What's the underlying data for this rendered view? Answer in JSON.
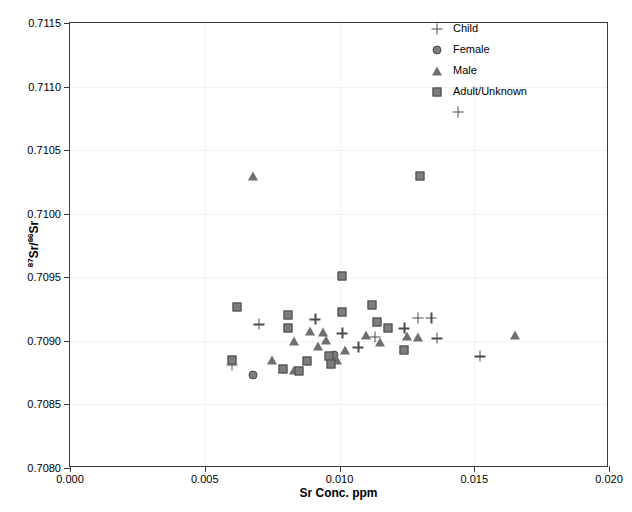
{
  "chart_data": {
    "type": "scatter",
    "title": "",
    "xlabel": "Sr Conc. ppm",
    "ylabel": "87Sr/86Sr",
    "ylabel_parts": {
      "sup1": "87",
      "mid": "Sr/",
      "sup2": "86",
      "tail": "Sr"
    },
    "xlim": [
      0.0,
      0.02
    ],
    "ylim": [
      0.708,
      0.7115
    ],
    "xticks": [
      0.0,
      0.005,
      0.01,
      0.015,
      0.02
    ],
    "xtick_labels": [
      "0.000",
      "0.005",
      "0.010",
      "0.015",
      "0.020"
    ],
    "yticks": [
      0.708,
      0.7085,
      0.709,
      0.7095,
      0.71,
      0.7105,
      0.711,
      0.7115
    ],
    "ytick_labels": [
      "0.7080",
      "0.7085",
      "0.7090",
      "0.7095",
      "0.7100",
      "0.7105",
      "0.7110",
      "0.7115"
    ],
    "grid": true,
    "legend_position": "top-right",
    "colors": {
      "marker_fill": "#7d7d7d",
      "marker_edge": "#4a4a4a",
      "frame": "#3a3a3a",
      "grid": "#f2f2f2",
      "background": "#ffffff"
    },
    "legend": [
      {
        "label": "Child",
        "marker": "cross-marker"
      },
      {
        "label": "Female",
        "marker": "circle-marker"
      },
      {
        "label": "Male",
        "marker": "triangle-marker"
      },
      {
        "label": "Adult/Unknown",
        "marker": "square-marker"
      }
    ],
    "series": [
      {
        "name": "Child",
        "marker": "cross-marker",
        "points": [
          [
            0.006,
            0.70881
          ],
          [
            0.007,
            0.70913
          ],
          [
            0.0091,
            0.70917
          ],
          [
            0.0101,
            0.70906
          ],
          [
            0.0107,
            0.70895
          ],
          [
            0.0113,
            0.70903
          ],
          [
            0.0124,
            0.7091
          ],
          [
            0.0129,
            0.70918
          ],
          [
            0.0134,
            0.70918
          ],
          [
            0.0136,
            0.70902
          ],
          [
            0.0144,
            0.7108
          ],
          [
            0.0152,
            0.70888
          ]
        ]
      },
      {
        "name": "Female",
        "marker": "circle-marker",
        "points": [
          [
            0.0068,
            0.70873
          ],
          [
            0.0098,
            0.70889
          ]
        ]
      },
      {
        "name": "Male",
        "marker": "triangle-marker",
        "points": [
          [
            0.0068,
            0.7103
          ],
          [
            0.0075,
            0.70885
          ],
          [
            0.0083,
            0.709
          ],
          [
            0.0083,
            0.70877
          ],
          [
            0.0089,
            0.70908
          ],
          [
            0.0092,
            0.70896
          ],
          [
            0.0094,
            0.70907
          ],
          [
            0.0095,
            0.70901
          ],
          [
            0.0099,
            0.70885
          ],
          [
            0.0102,
            0.70893
          ],
          [
            0.011,
            0.70905
          ],
          [
            0.0115,
            0.70899
          ],
          [
            0.0125,
            0.70904
          ],
          [
            0.0129,
            0.70903
          ],
          [
            0.0165,
            0.70905
          ]
        ]
      },
      {
        "name": "Adult/Unknown",
        "marker": "square-marker",
        "points": [
          [
            0.006,
            0.70885
          ],
          [
            0.0062,
            0.70927
          ],
          [
            0.0079,
            0.70878
          ],
          [
            0.0081,
            0.7092
          ],
          [
            0.0081,
            0.7091
          ],
          [
            0.0085,
            0.70876
          ],
          [
            0.0088,
            0.70884
          ],
          [
            0.0096,
            0.70888
          ],
          [
            0.0097,
            0.70882
          ],
          [
            0.0101,
            0.70951
          ],
          [
            0.0101,
            0.70923
          ],
          [
            0.0112,
            0.70928
          ],
          [
            0.0114,
            0.70915
          ],
          [
            0.0118,
            0.7091
          ],
          [
            0.0124,
            0.70893
          ],
          [
            0.013,
            0.7103
          ]
        ]
      }
    ]
  }
}
